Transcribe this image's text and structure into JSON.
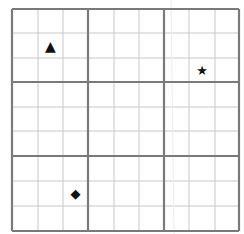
{
  "board": {
    "rows": 9,
    "cols": 9,
    "box_size": 3,
    "colors": {
      "background": "#ffffff",
      "thin_line": "#c8c8c8",
      "thick_line": "#7a7a7a",
      "symbol": "#111111",
      "artifact": "#e6e6e6"
    },
    "pieces": [
      {
        "name": "triangle",
        "icon": "triangle-icon",
        "glyph": "▲",
        "row": 2,
        "col": 2
      },
      {
        "name": "star",
        "icon": "star-icon",
        "glyph": "★",
        "row": 3,
        "col": 8
      },
      {
        "name": "diamond",
        "icon": "diamond-icon",
        "glyph": "◆",
        "row": 8,
        "col": 3
      }
    ]
  }
}
